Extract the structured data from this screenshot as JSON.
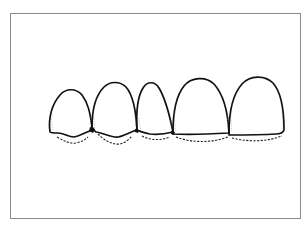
{
  "figure": {
    "teeth_count": 5,
    "colors": {
      "outline": "#111111",
      "frame": "#8a8a8a",
      "background": "#ffffff"
    }
  }
}
